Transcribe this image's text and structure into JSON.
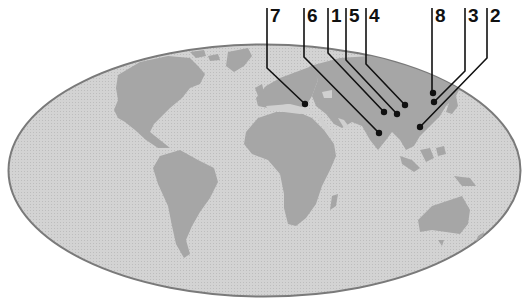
{
  "figure": {
    "type": "world-map-locator",
    "colors": {
      "background": "#ffffff",
      "ocean": "#d0d0d0",
      "land": "#a6a6a6",
      "outline": "#7a7a7a",
      "leader": "#111111"
    }
  },
  "markers": [
    {
      "label": "7",
      "label_x": 270,
      "line_x": 267,
      "bend_y": 68,
      "dot": [
        305,
        104
      ]
    },
    {
      "label": "6",
      "label_x": 307,
      "line_x": 304,
      "bend_y": 57,
      "dot": [
        379,
        133
      ]
    },
    {
      "label": "1",
      "label_x": 331,
      "line_x": 328,
      "bend_y": 53,
      "dot": [
        384,
        112
      ]
    },
    {
      "label": "5",
      "label_x": 349,
      "line_x": 346,
      "bend_y": 60,
      "dot": [
        397,
        114
      ]
    },
    {
      "label": "4",
      "label_x": 369,
      "line_x": 366,
      "bend_y": 64,
      "dot": [
        405,
        105
      ]
    },
    {
      "label": "8",
      "label_x": 435,
      "line_x": 432,
      "bend_y": 93,
      "dot": [
        433,
        93
      ]
    },
    {
      "label": "3",
      "label_x": 468,
      "line_x": 465,
      "bend_y": 71,
      "dot": [
        434,
        102
      ]
    },
    {
      "label": "2",
      "label_x": 490,
      "line_x": 487,
      "bend_y": 58,
      "dot": [
        420,
        127
      ]
    }
  ]
}
